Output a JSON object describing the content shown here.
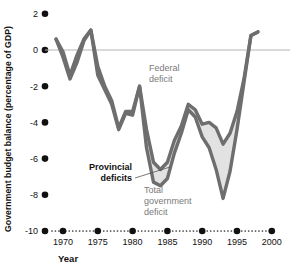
{
  "chart_data": {
    "type": "line",
    "title": "",
    "xlabel": "Year",
    "ylabel": "Government budget balance (percentage of GDP)",
    "xlim": [
      1969,
      2000
    ],
    "ylim": [
      -10,
      2
    ],
    "grid": false,
    "zero_line": true,
    "legend_position": "inline-annotations",
    "y_ticks": [
      2,
      0,
      -2,
      -4,
      -6,
      -8,
      -10
    ],
    "y_tick_labels": [
      "2",
      "0",
      "-2",
      "-4",
      "-6",
      "-8",
      "-10"
    ],
    "x_ticks": [
      1970,
      1975,
      1980,
      1985,
      1990,
      1995,
      2000
    ],
    "x_tick_labels": [
      "1970",
      "1975",
      "1980",
      "1985",
      "1990",
      "1995",
      "2000"
    ],
    "series": [
      {
        "name": "Federal deficit",
        "color": "#6e6e6e",
        "x": [
          1969,
          1970,
          1971,
          1972,
          1973,
          1974,
          1975,
          1976,
          1977,
          1978,
          1979,
          1980,
          1981,
          1982,
          1983,
          1984,
          1985,
          1986,
          1987,
          1988,
          1989,
          1990,
          1991,
          1992,
          1993,
          1994,
          1995,
          1996,
          1997,
          1998
        ],
        "values": [
          0.6,
          -0.1,
          -1.4,
          -0.3,
          0.6,
          1.1,
          -0.9,
          -2.0,
          -2.8,
          -4.3,
          -3.4,
          -3.4,
          -2.0,
          -4.4,
          -6.2,
          -6.6,
          -6.2,
          -5.0,
          -4.2,
          -3.0,
          -3.3,
          -4.1,
          -4.0,
          -4.3,
          -5.2,
          -4.6,
          -3.4,
          -1.6,
          0.8,
          1.0
        ]
      },
      {
        "name": "Total government deficit",
        "color": "#6e6e6e",
        "x": [
          1969,
          1970,
          1971,
          1972,
          1973,
          1974,
          1975,
          1976,
          1977,
          1978,
          1979,
          1980,
          1981,
          1982,
          1983,
          1984,
          1985,
          1986,
          1987,
          1988,
          1989,
          1990,
          1991,
          1992,
          1993,
          1994,
          1995,
          1996,
          1997,
          1998
        ],
        "values": [
          0.6,
          -0.4,
          -1.6,
          -0.7,
          0.5,
          1.1,
          -1.4,
          -2.2,
          -3.0,
          -4.4,
          -3.5,
          -3.6,
          -2.0,
          -5.4,
          -7.3,
          -7.5,
          -7.1,
          -5.7,
          -4.6,
          -3.3,
          -3.7,
          -4.8,
          -5.4,
          -6.6,
          -8.2,
          -6.7,
          -4.4,
          -1.8,
          0.8,
          1.0
        ]
      }
    ],
    "band": {
      "name": "Provincial deficits",
      "fill": "#e2e2e2",
      "between": [
        "Federal deficit",
        "Total government deficit"
      ]
    },
    "annotations": [
      {
        "name": "federal-deficit",
        "lines": [
          "Federal",
          "deficit"
        ],
        "x": 1986,
        "y": -1.55,
        "style": "gray"
      },
      {
        "name": "provincial-deficits",
        "lines": [
          "Provincial",
          "deficits"
        ],
        "x": 1982.6,
        "y": -7.0,
        "style": "bold",
        "leader": true
      },
      {
        "name": "total-government-deficit",
        "lines": [
          "Total",
          "government",
          "deficit"
        ],
        "x": 1985.2,
        "y": -8.1,
        "style": "gray"
      }
    ]
  },
  "axis": {
    "ylabel": "Government budget balance (percentage of GDP)",
    "xlabel": "Year",
    "ytick_labels": [
      "2",
      "0",
      "-2",
      "-4",
      "-6",
      "-8",
      "-10"
    ],
    "xtick_labels": [
      "1970",
      "1975",
      "1980",
      "1985",
      "1990",
      "1995",
      "2000"
    ]
  },
  "annotations": {
    "federal_line1": "Federal",
    "federal_line2": "deficit",
    "provincial_line1": "Provincial",
    "provincial_line2": "deficits",
    "total_line1": "Total",
    "total_line2": "government",
    "total_line3": "deficit"
  },
  "colors": {
    "line": "#6e6e6e",
    "band_fill": "#e2e2e2",
    "zero_line": "#b4b4b4",
    "text": "#111111",
    "gray_text": "#7a7a7a",
    "dot": "#111111"
  }
}
